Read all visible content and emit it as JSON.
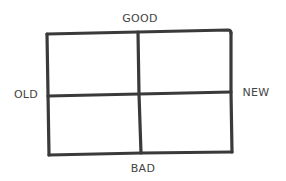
{
  "diagram": {
    "type": "quadrant-matrix",
    "labels": {
      "top": "GOOD",
      "bottom": "BAD",
      "left": "OLD",
      "right": "NEW"
    },
    "quadrants": [
      {
        "position": "top-left",
        "text": ""
      },
      {
        "position": "top-right",
        "text": ""
      },
      {
        "position": "bottom-left",
        "text": ""
      },
      {
        "position": "bottom-right",
        "text": ""
      }
    ],
    "colors": {
      "line": "#3a3a3a",
      "text": "#444444",
      "background": "#ffffff"
    }
  }
}
